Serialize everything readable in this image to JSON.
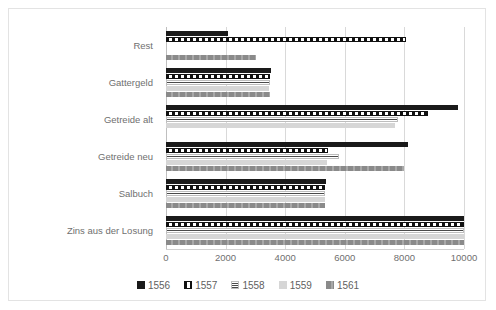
{
  "chart_data": {
    "type": "bar",
    "orientation": "horizontal",
    "title": "",
    "subtitle": "",
    "xlabel": "",
    "ylabel": "",
    "xlim": [
      0,
      10000
    ],
    "xticks": [
      "0",
      "2000",
      "4000",
      "6000",
      "8000",
      "10000"
    ],
    "xtick_values": [
      0,
      2000,
      4000,
      6000,
      8000,
      10000
    ],
    "grid": true,
    "legend_position": "bottom",
    "categories": [
      "Rest",
      "Gattergeld",
      "Getreide alt",
      "Getreide neu",
      "Salbuch",
      "Zins aus der Losung"
    ],
    "series": [
      {
        "name": "1556",
        "color": "#1a1a1a",
        "pattern": "solid-black",
        "values": [
          2080,
          3520,
          9800,
          8120,
          5380,
          10000
        ]
      },
      {
        "name": "1557",
        "color": "#111111",
        "pattern": "checkerboard",
        "values": [
          8050,
          3500,
          8800,
          5420,
          5350,
          10000
        ]
      },
      {
        "name": "1558",
        "color": "#4a4a4a",
        "pattern": "horizontal-lines",
        "values": [
          0,
          3480,
          7800,
          5800,
          5340,
          10000
        ]
      },
      {
        "name": "1559",
        "color": "#d6d6d6",
        "pattern": "light-gray-solid",
        "values": [
          0,
          3460,
          7680,
          5400,
          5330,
          10000
        ]
      },
      {
        "name": "1561",
        "color": "#8a8a8a",
        "pattern": "gray-dashed",
        "values": [
          3020,
          3500,
          0,
          8000,
          5340,
          10000
        ]
      }
    ]
  }
}
